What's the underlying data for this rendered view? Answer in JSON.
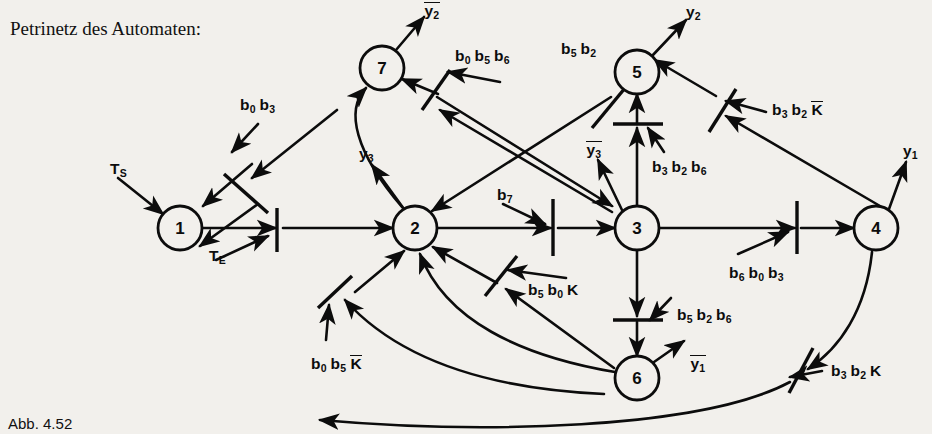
{
  "figure": {
    "title": "Petrinetz des Automaten:",
    "caption": "Abb. 4.52",
    "type": "petri-net",
    "ink_color": "#0c0c0c",
    "background_color": "#f2f0ec"
  },
  "places": [
    {
      "id": "p1",
      "label": "1",
      "cx": 180,
      "cy": 228,
      "r": 22
    },
    {
      "id": "p2",
      "label": "2",
      "cx": 415,
      "cy": 228,
      "r": 22
    },
    {
      "id": "p3",
      "label": "3",
      "cx": 637,
      "cy": 228,
      "r": 22
    },
    {
      "id": "p4",
      "label": "4",
      "cx": 876,
      "cy": 228,
      "r": 22
    },
    {
      "id": "p5",
      "label": "5",
      "cx": 637,
      "cy": 72,
      "r": 22
    },
    {
      "id": "p6",
      "label": "6",
      "cx": 637,
      "cy": 378,
      "r": 22
    },
    {
      "id": "p7",
      "label": "7",
      "cx": 382,
      "cy": 68,
      "r": 22
    }
  ],
  "inputs": [
    {
      "name": "start-signal",
      "text": "T",
      "sub": "S",
      "x": 110,
      "y": 160
    },
    {
      "name": "enable-signal",
      "text": "T",
      "sub": "E",
      "x": 209,
      "y": 247
    }
  ],
  "outputs": [
    {
      "name": "y2-bar-output",
      "base": "y",
      "sub": "2",
      "overline": true,
      "x": 424,
      "y": 2
    },
    {
      "name": "y2-output",
      "base": "y",
      "sub": "2",
      "overline": false,
      "x": 686,
      "y": 3
    },
    {
      "name": "y1-output",
      "base": "y",
      "sub": "1",
      "overline": false,
      "x": 903,
      "y": 142
    },
    {
      "name": "y3-output",
      "base": "y",
      "sub": "3",
      "overline": false,
      "x": 359,
      "y": 145
    },
    {
      "name": "y3-bar-output",
      "base": "y",
      "sub": "3",
      "overline": true,
      "x": 586,
      "y": 141
    },
    {
      "name": "y1-bar-output",
      "base": "y",
      "sub": "1",
      "overline": true,
      "x": 690,
      "y": 355
    }
  ],
  "transition_labels": [
    {
      "name": "label-b0-b3",
      "x": 240,
      "y": 96,
      "terms": [
        {
          "b": "b",
          "s": "0"
        },
        {
          "b": "b",
          "s": "3"
        }
      ]
    },
    {
      "name": "label-b0-b5-b6",
      "x": 455,
      "y": 47,
      "terms": [
        {
          "b": "b",
          "s": "0"
        },
        {
          "b": "b",
          "s": "5"
        },
        {
          "b": "b",
          "s": "6"
        }
      ]
    },
    {
      "name": "label-b5-b2",
      "x": 561,
      "y": 40,
      "terms": [
        {
          "b": "b",
          "s": "5"
        },
        {
          "b": "b",
          "s": "2"
        }
      ]
    },
    {
      "name": "label-b3-b2-Kbar",
      "x": 772,
      "y": 101,
      "terms": [
        {
          "b": "b",
          "s": "3"
        },
        {
          "b": "b",
          "s": "2"
        },
        {
          "b": "K",
          "s": "",
          "over": true
        }
      ]
    },
    {
      "name": "label-b3-b2-b6",
      "x": 652,
      "y": 158,
      "terms": [
        {
          "b": "b",
          "s": "3"
        },
        {
          "b": "b",
          "s": "2"
        },
        {
          "b": "b",
          "s": "6"
        }
      ]
    },
    {
      "name": "label-b7",
      "x": 497,
      "y": 186,
      "terms": [
        {
          "b": "b",
          "s": "7"
        }
      ]
    },
    {
      "name": "label-b6-b0-b3",
      "x": 729,
      "y": 264,
      "terms": [
        {
          "b": "b",
          "s": "6"
        },
        {
          "b": "b",
          "s": "0"
        },
        {
          "b": "b",
          "s": "3"
        }
      ]
    },
    {
      "name": "label-b5-b0-K",
      "x": 528,
      "y": 281,
      "terms": [
        {
          "b": "b",
          "s": "5"
        },
        {
          "b": "b",
          "s": "0"
        },
        {
          "b": "K",
          "s": ""
        }
      ]
    },
    {
      "name": "label-b5-b2-b6",
      "x": 677,
      "y": 306,
      "terms": [
        {
          "b": "b",
          "s": "5"
        },
        {
          "b": "b",
          "s": "2"
        },
        {
          "b": "b",
          "s": "6"
        }
      ]
    },
    {
      "name": "label-b0-b5-Kbar",
      "x": 311,
      "y": 355,
      "terms": [
        {
          "b": "b",
          "s": "0"
        },
        {
          "b": "b",
          "s": "5"
        },
        {
          "b": "K",
          "s": "",
          "over": true
        }
      ]
    },
    {
      "name": "label-b3-b2-K",
      "x": 831,
      "y": 362,
      "terms": [
        {
          "b": "b",
          "s": "3"
        },
        {
          "b": "b",
          "s": "2"
        },
        {
          "b": "K",
          "s": ""
        }
      ]
    }
  ],
  "arcs": [
    {
      "name": "arc-ts-to-p1",
      "d": "M 118 178 L 163 214"
    },
    {
      "name": "arc-p1-to-bar1",
      "d": "M 202 228 L 276 228"
    },
    {
      "name": "arc-bar1-to-p2",
      "d": "M 283 228 L 393 228"
    },
    {
      "name": "arc-te-to-bar1",
      "d": "M 216 260 L 268 236"
    },
    {
      "name": "arc-p7-loop-p1",
      "d": "M 258 204 L 200 246"
    },
    {
      "name": "arc-b0b3-down",
      "d": "M 252 164 L 203 206"
    },
    {
      "name": "arc-b0b3-in",
      "d": "M 258 124 L 232 152"
    },
    {
      "name": "arc-far-to-b0b3",
      "d": "M 337 110 L 252 178"
    },
    {
      "name": "arc-p7-out-y2",
      "d": "M 396 50 L 424 17"
    },
    {
      "name": "arc-barA-to-p7",
      "d": "M 438 94 L 402 79"
    },
    {
      "name": "arc-in-barA-1",
      "d": "M 500 82 L 448 72"
    },
    {
      "name": "arc-in-barA-2",
      "d": "M 612 212 L 440 110"
    },
    {
      "name": "arc-p2-to-p7curve",
      "d": "M 402 207 C 355 152 345 110 366 88"
    },
    {
      "name": "arc-p2-out-y3",
      "d": "M 404 209 L 372 165"
    },
    {
      "name": "arc-diag-5to2",
      "d": "M 611 97 L 432 211"
    },
    {
      "name": "arc-diag-2to5",
      "d": "M 437 97 L 612 206"
    },
    {
      "name": "arc-p5-out-y2",
      "d": "M 652 56 L 686 20"
    },
    {
      "name": "arc-barB-to-p5",
      "d": "M 716 96 L 655 60"
    },
    {
      "name": "arc-in-barB-1",
      "d": "M 766 112 L 726 101"
    },
    {
      "name": "arc-in-barB-2",
      "d": "M 880 206 L 726 116"
    },
    {
      "name": "arc-p3-to-p5",
      "d": "M 637 206 L 637 128"
    },
    {
      "name": "arc-bar-p3p5-up",
      "d": "M 637 124 L 637 94"
    },
    {
      "name": "arc-b3b2b6-in",
      "d": "M 664 152 L 648 128"
    },
    {
      "name": "arc-p3-out-y3b",
      "d": "M 622 210 L 598 160"
    },
    {
      "name": "arc-p2-to-bar7",
      "d": "M 437 228 L 551 228"
    },
    {
      "name": "arc-bar7-to-p3",
      "d": "M 558 228 L 615 228"
    },
    {
      "name": "arc-b7-to-bar7",
      "d": "M 503 204 L 545 224"
    },
    {
      "name": "arc-p3-to-bar8",
      "d": "M 659 228 L 795 228"
    },
    {
      "name": "arc-bar8-to-p4",
      "d": "M 801 228 L 854 228"
    },
    {
      "name": "arc-b6b0b3-in",
      "d": "M 738 254 L 788 232"
    },
    {
      "name": "arc-p4-out-y1",
      "d": "M 889 209 L 906 162"
    },
    {
      "name": "arc-p3-to-p6",
      "d": "M 637 250 L 637 316"
    },
    {
      "name": "arc-bar-p3p6-dn",
      "d": "M 637 322 L 637 356"
    },
    {
      "name": "arc-b5b2b6-in",
      "d": "M 671 298 L 650 320"
    },
    {
      "name": "arc-p6-out-y1b",
      "d": "M 654 362 L 684 341"
    },
    {
      "name": "arc-p6-curve-p2",
      "d": "M 615 372 C 520 356 445 320 420 254"
    },
    {
      "name": "arc-barC-to-p2",
      "d": "M 497 283 L 433 247"
    },
    {
      "name": "arc-in-barC-1",
      "d": "M 566 278 L 508 270"
    },
    {
      "name": "arc-in-barC-2",
      "d": "M 614 368 L 506 289"
    },
    {
      "name": "arc-barD-to-p2",
      "d": "M 355 292 L 404 251"
    },
    {
      "name": "arc-in-barD-1",
      "d": "M 326 340 L 329 305"
    },
    {
      "name": "arc-in-barD-2",
      "d": "M 604 394 C 470 388 390 350 345 300"
    },
    {
      "name": "arc-p4-curve-to-barE",
      "d": "M 872 252 C 866 310 840 348 808 369"
    },
    {
      "name": "arc-barE-to-p6curve",
      "d": "M 790 382 C 700 430 480 434 320 420"
    },
    {
      "name": "arc-b3b2K-in",
      "d": "M 822 371 L 790 377"
    }
  ],
  "bars": [
    {
      "name": "bar-te",
      "x1": 277,
      "y1": 208,
      "x2": 277,
      "y2": 252
    },
    {
      "name": "bar-b0b3",
      "x1": 224,
      "y1": 174,
      "x2": 268,
      "y2": 213
    },
    {
      "name": "bar-b0b5b6",
      "x1": 422,
      "y1": 110,
      "x2": 450,
      "y2": 70
    },
    {
      "name": "bar-b5b2",
      "x1": 592,
      "y1": 128,
      "x2": 630,
      "y2": 82
    },
    {
      "name": "bar-b3b2Kbar",
      "x1": 709,
      "y1": 132,
      "x2": 736,
      "y2": 89
    },
    {
      "name": "bar-35",
      "x1": 613,
      "y1": 124,
      "x2": 663,
      "y2": 124
    },
    {
      "name": "bar-b7",
      "x1": 553,
      "y1": 199,
      "x2": 553,
      "y2": 256
    },
    {
      "name": "bar-b6b0b3",
      "x1": 797,
      "y1": 201,
      "x2": 797,
      "y2": 254
    },
    {
      "name": "bar-36",
      "x1": 613,
      "y1": 320,
      "x2": 663,
      "y2": 320
    },
    {
      "name": "bar-b5b0K",
      "x1": 485,
      "y1": 296,
      "x2": 517,
      "y2": 256
    },
    {
      "name": "bar-b0b5Kbar",
      "x1": 318,
      "y1": 308,
      "x2": 352,
      "y2": 276
    },
    {
      "name": "bar-b3b2K",
      "x1": 789,
      "y1": 393,
      "x2": 813,
      "y2": 348
    }
  ]
}
